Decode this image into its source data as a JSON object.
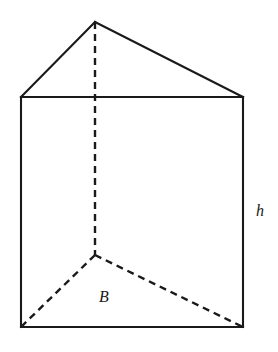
{
  "figure": {
    "name": "triangular-prism",
    "canvas": {
      "width": 278,
      "height": 352
    },
    "background_color": "#ffffff",
    "stroke_color": "#1a1a1a",
    "solid_stroke_width": 2.1,
    "dashed_stroke_width": 2.4,
    "dash_pattern": "7 5"
  },
  "vertices": {
    "apex_front_top": {
      "x": 95,
      "y": 22
    },
    "top_left": {
      "x": 21,
      "y": 97
    },
    "top_right": {
      "x": 243,
      "y": 97
    },
    "bottom_left": {
      "x": 21,
      "y": 327
    },
    "bottom_right": {
      "x": 243,
      "y": 327
    },
    "hidden_back_vertex": {
      "x": 95,
      "y": 255
    }
  },
  "edges": {
    "solid": [
      {
        "name": "top-left-slant",
        "from": "apex_front_top",
        "to": "top_left"
      },
      {
        "name": "top-right-slant",
        "from": "apex_front_top",
        "to": "top_right"
      },
      {
        "name": "front-face-top",
        "from": "top_left",
        "to": "top_right"
      },
      {
        "name": "front-face-left",
        "from": "top_left",
        "to": "bottom_left"
      },
      {
        "name": "front-face-right",
        "from": "top_right",
        "to": "bottom_right"
      },
      {
        "name": "front-face-bottom",
        "from": "bottom_left",
        "to": "bottom_right"
      }
    ],
    "dashed": [
      {
        "name": "hidden-vertical-edge",
        "from": "apex_front_top",
        "to": "hidden_back_vertex"
      },
      {
        "name": "hidden-base-left",
        "from": "hidden_back_vertex",
        "to": "bottom_left"
      },
      {
        "name": "hidden-base-right",
        "from": "hidden_back_vertex",
        "to": "bottom_right"
      }
    ]
  },
  "labels": {
    "height": {
      "text": "h",
      "x": 256,
      "y": 216,
      "meaning": "height of the prism"
    },
    "base": {
      "text": "B",
      "x": 99,
      "y": 302,
      "meaning": "area of the triangular base"
    }
  }
}
